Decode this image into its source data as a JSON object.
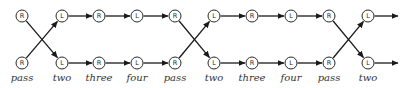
{
  "diagram": {
    "type": "state-transition-sequence",
    "colors": {
      "stroke": "#1a1a1a",
      "node_fill": "#ffffff",
      "label": "#333333"
    },
    "rows": {
      "top_y": 16,
      "bottom_y": 63,
      "label_y": 81
    },
    "node_radius": 6,
    "columns": [
      {
        "x": 22,
        "top": "R",
        "bottom": "R",
        "label": "pass"
      },
      {
        "x": 62,
        "top": "L",
        "bottom": "L",
        "label": "two"
      },
      {
        "x": 99,
        "top": "R",
        "bottom": "R",
        "label": "three"
      },
      {
        "x": 137,
        "top": "L",
        "bottom": "L",
        "label": "four"
      },
      {
        "x": 175,
        "top": "R",
        "bottom": "R",
        "label": "pass"
      },
      {
        "x": 214,
        "top": "L",
        "bottom": "L",
        "label": "two"
      },
      {
        "x": 252,
        "top": "R",
        "bottom": "R",
        "label": "three"
      },
      {
        "x": 291,
        "top": "L",
        "bottom": "L",
        "label": "four"
      },
      {
        "x": 329,
        "top": "R",
        "bottom": "R",
        "label": "pass"
      },
      {
        "x": 368,
        "top": "L",
        "bottom": "L",
        "label": "two"
      }
    ],
    "crossings": [
      [
        0,
        1
      ],
      [
        4,
        5
      ],
      [
        8,
        9
      ]
    ],
    "straight_edges": [
      [
        1,
        2
      ],
      [
        2,
        3
      ],
      [
        3,
        4
      ],
      [
        5,
        6
      ],
      [
        6,
        7
      ],
      [
        7,
        8
      ]
    ],
    "trailing_arrows": {
      "from_column": 9,
      "end_x": 398
    }
  }
}
